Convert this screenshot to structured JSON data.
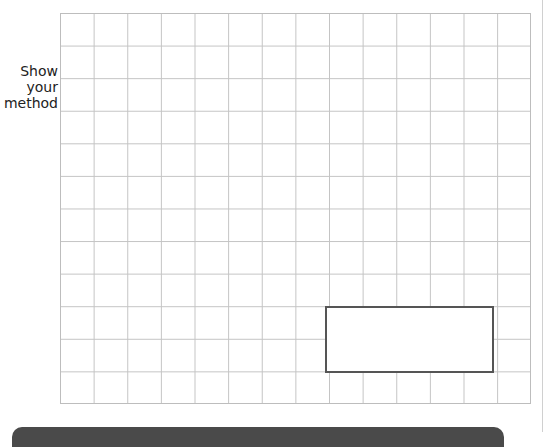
{
  "side_label": {
    "lines": [
      "Show",
      "your",
      "method"
    ]
  },
  "working_grid": {
    "columns": 14,
    "rows": 12,
    "line_color": "#c4c4c4"
  },
  "answer_box": {
    "value": "",
    "border_color": "#555555"
  },
  "footer_bar": {
    "color": "#4a4a4a"
  }
}
